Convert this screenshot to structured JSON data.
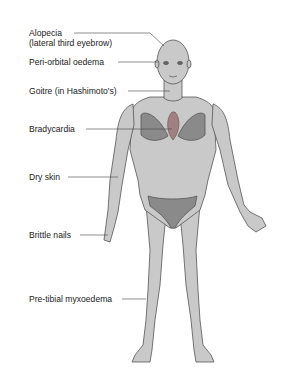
{
  "diagram": {
    "colors": {
      "skin": "#c9c9c9",
      "outline": "#555555",
      "garment": "#8a8a8a",
      "heart": "#a08080",
      "leader_line": "#444444",
      "text": "#222222"
    },
    "labels": [
      {
        "id": "alopecia",
        "line1": "Alopecia",
        "line2": "(lateral third eyebrow)"
      },
      {
        "id": "periorbital",
        "line1": "Peri-orbital oedema"
      },
      {
        "id": "goitre",
        "line1": "Goitre (in Hashimoto's)"
      },
      {
        "id": "bradycardia",
        "line1": "Bradycardia"
      },
      {
        "id": "dry-skin",
        "line1": "Dry skin"
      },
      {
        "id": "brittle-nails",
        "line1": "Brittle nails"
      },
      {
        "id": "pretibial",
        "line1": "Pre-tibial myxoedema"
      }
    ]
  }
}
